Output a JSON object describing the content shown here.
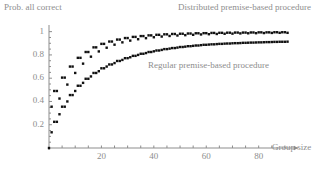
{
  "chart_data": {
    "type": "scatter",
    "title": "",
    "xlabel": "Group size",
    "ylabel": "Prob. all correct",
    "xlim": [
      0,
      95
    ],
    "ylim": [
      0,
      1.04
    ],
    "grid": false,
    "legend_position": "inline-annotations",
    "xticks": [
      20,
      40,
      60,
      80
    ],
    "xtick_labels": [
      "20",
      "40",
      "60",
      "80"
    ],
    "yticks": [
      0.2,
      0.4,
      0.6,
      0.8,
      1.0
    ],
    "ytick_labels": [
      "0.2",
      "0.4",
      "0.6",
      "0.8",
      "1"
    ],
    "marker": "square",
    "marker_color": "#111111",
    "annotations": [
      {
        "text": "Distributed premise-based procedure",
        "x": 55,
        "y": 1.02
      },
      {
        "text": "Regular premise-based procedure",
        "x": 40,
        "y": 0.655
      }
    ],
    "series": [
      {
        "name": "Distributed premise-based procedure",
        "x": [
          1,
          2,
          3,
          4,
          5,
          6,
          7,
          8,
          9,
          10,
          11,
          12,
          13,
          14,
          15,
          16,
          17,
          18,
          19,
          20,
          21,
          22,
          23,
          24,
          25,
          26,
          27,
          28,
          29,
          30,
          31,
          32,
          33,
          34,
          35,
          36,
          37,
          38,
          39,
          40,
          41,
          42,
          43,
          44,
          45,
          46,
          47,
          48,
          49,
          50,
          51,
          52,
          53,
          54,
          55,
          56,
          57,
          58,
          59,
          60,
          61,
          62,
          63,
          64,
          65,
          66,
          67,
          68,
          69,
          70,
          71,
          72,
          73,
          74,
          75,
          76,
          77,
          78,
          79,
          80,
          81,
          82,
          83,
          84,
          85,
          86,
          87,
          88,
          89,
          90,
          91
        ],
        "y": [
          0.355,
          0.49,
          0.49,
          0.425,
          0.605,
          0.605,
          0.545,
          0.7,
          0.7,
          0.645,
          0.775,
          0.775,
          0.725,
          0.825,
          0.825,
          0.785,
          0.865,
          0.865,
          0.83,
          0.895,
          0.895,
          0.862,
          0.915,
          0.915,
          0.888,
          0.932,
          0.932,
          0.908,
          0.945,
          0.945,
          0.923,
          0.955,
          0.955,
          0.935,
          0.962,
          0.962,
          0.944,
          0.968,
          0.968,
          0.952,
          0.973,
          0.973,
          0.958,
          0.977,
          0.977,
          0.963,
          0.98,
          0.98,
          0.967,
          0.982,
          0.982,
          0.97,
          0.984,
          0.984,
          0.973,
          0.986,
          0.986,
          0.976,
          0.987,
          0.987,
          0.978,
          0.989,
          0.989,
          0.98,
          0.99,
          0.99,
          0.982,
          0.991,
          0.991,
          0.983,
          0.992,
          0.992,
          0.985,
          0.992,
          0.992,
          0.986,
          0.993,
          0.993,
          0.987,
          0.994,
          0.994,
          0.988,
          0.994,
          0.994,
          0.989,
          0.995,
          0.995,
          0.99,
          0.995,
          0.995,
          0.99
        ]
      },
      {
        "name": "Regular premise-based procedure",
        "x": [
          1,
          2,
          3,
          4,
          5,
          6,
          7,
          8,
          9,
          10,
          11,
          12,
          13,
          14,
          15,
          16,
          17,
          18,
          19,
          20,
          21,
          22,
          23,
          24,
          25,
          26,
          27,
          28,
          29,
          30,
          31,
          32,
          33,
          34,
          35,
          36,
          37,
          38,
          39,
          40,
          41,
          42,
          43,
          44,
          45,
          46,
          47,
          48,
          49,
          50,
          51,
          52,
          53,
          54,
          55,
          56,
          57,
          58,
          59,
          60,
          61,
          62,
          63,
          64,
          65,
          66,
          67,
          68,
          69,
          70,
          71,
          72,
          73,
          74,
          75,
          76,
          77,
          78,
          79,
          80,
          81,
          82,
          83,
          84,
          85,
          86,
          87,
          88,
          89,
          90,
          91
        ],
        "y": [
          0.135,
          0.225,
          0.225,
          0.29,
          0.355,
          0.355,
          0.4,
          0.455,
          0.455,
          0.49,
          0.535,
          0.535,
          0.56,
          0.595,
          0.595,
          0.615,
          0.645,
          0.645,
          0.66,
          0.685,
          0.685,
          0.7,
          0.718,
          0.718,
          0.73,
          0.748,
          0.748,
          0.757,
          0.772,
          0.772,
          0.78,
          0.792,
          0.792,
          0.8,
          0.81,
          0.81,
          0.816,
          0.825,
          0.825,
          0.831,
          0.838,
          0.838,
          0.843,
          0.85,
          0.85,
          0.854,
          0.859,
          0.859,
          0.863,
          0.868,
          0.868,
          0.871,
          0.875,
          0.875,
          0.878,
          0.881,
          0.881,
          0.884,
          0.887,
          0.887,
          0.889,
          0.891,
          0.891,
          0.893,
          0.895,
          0.895,
          0.897,
          0.898,
          0.898,
          0.9,
          0.901,
          0.901,
          0.902,
          0.904,
          0.904,
          0.905,
          0.906,
          0.906,
          0.907,
          0.908,
          0.908,
          0.909,
          0.91,
          0.91,
          0.911,
          0.912,
          0.912,
          0.913,
          0.913,
          0.913,
          0.914
        ]
      }
    ]
  },
  "axes": {
    "ylabel": "Prob. all correct",
    "xlabel": "Group size",
    "xtick_labels": [
      "20",
      "40",
      "60",
      "80"
    ],
    "ytick_labels": [
      "1",
      "0.8",
      "0.6",
      "0.4",
      "0.2"
    ]
  },
  "annotations": {
    "distributed": "Distributed premise-based procedure",
    "regular": "Regular premise-based procedure"
  },
  "colors": {
    "marker": "#111111",
    "axis": "#8d8d8d",
    "text": "#8d8d8d",
    "background": "#ffffff"
  }
}
